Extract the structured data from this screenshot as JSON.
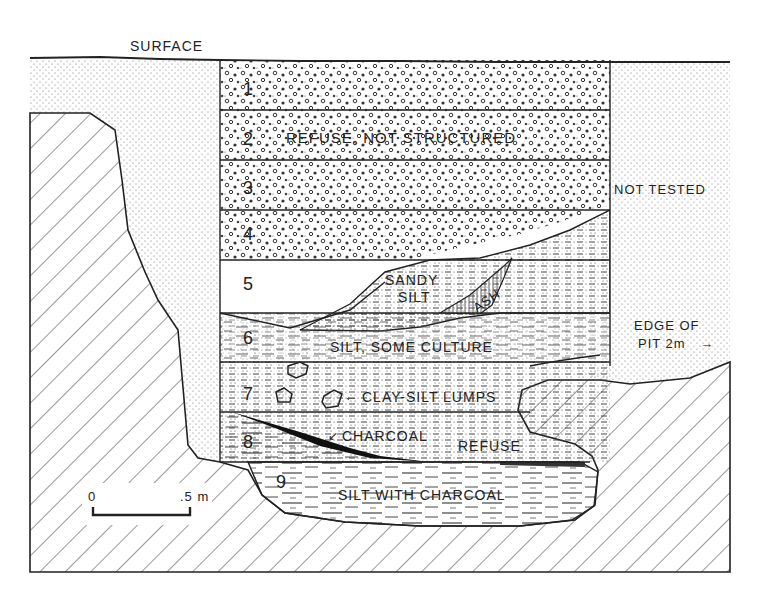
{
  "figure": {
    "type": "stratigraphic-profile",
    "surface_label": "SURFACE",
    "not_tested_label": "NOT TESTED",
    "edge_of_pit_label_1": "EDGE OF",
    "edge_of_pit_label_2": "PIT 2m",
    "edge_arrow": "→",
    "scale_bar": {
      "start": "0",
      "end": ".5 m"
    }
  },
  "layers": [
    {
      "number": "1",
      "label": ""
    },
    {
      "number": "2",
      "label": "REFUSE, NOT STRUCTURED"
    },
    {
      "number": "3",
      "label": ""
    },
    {
      "number": "4",
      "label": ""
    },
    {
      "number": "5",
      "label": ""
    },
    {
      "number": "6",
      "label": "SILT, SOME CULTURE"
    },
    {
      "number": "7",
      "label": "CLAY-SILT LUMPS"
    },
    {
      "number": "8",
      "label": "CHARCOAL"
    },
    {
      "number": "9",
      "label": "SILT WITH CHARCOAL"
    }
  ],
  "annotations": {
    "sandy_1": "SANDY",
    "sandy_2": "SILT",
    "ash": "ASH",
    "refuse": "REFUSE",
    "lumps_arrow": "←",
    "charcoal_arrow": "↙"
  },
  "colors": {
    "ink": "#222222",
    "paper": "#ffffff"
  }
}
